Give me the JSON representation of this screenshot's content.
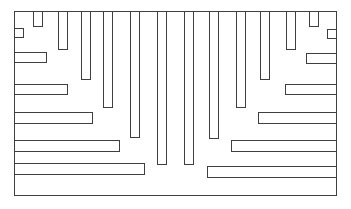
{
  "figure": {
    "type": "line-drawing",
    "canvas": {
      "width": 351,
      "height": 209,
      "background": "#ffffff"
    },
    "style": {
      "stroke": "#3f3f3f",
      "stroke_width_px": 1.5,
      "fill": "#ffffff"
    },
    "rects": [
      {
        "name": "outer-frame",
        "x": 14,
        "y": 11,
        "w": 323,
        "h": 185
      },
      {
        "name": "top-bar-1",
        "x": 33,
        "y": 11,
        "w": 10,
        "h": 16
      },
      {
        "name": "top-bar-2",
        "x": 58,
        "y": 11,
        "w": 10,
        "h": 39
      },
      {
        "name": "top-bar-3",
        "x": 81,
        "y": 11,
        "w": 10,
        "h": 69
      },
      {
        "name": "top-bar-4",
        "x": 103,
        "y": 11,
        "w": 10,
        "h": 97
      },
      {
        "name": "top-bar-5",
        "x": 130,
        "y": 11,
        "w": 10,
        "h": 127
      },
      {
        "name": "top-bar-6",
        "x": 157,
        "y": 11,
        "w": 10,
        "h": 154
      },
      {
        "name": "top-bar-7",
        "x": 184,
        "y": 11,
        "w": 10,
        "h": 154
      },
      {
        "name": "top-bar-8",
        "x": 209,
        "y": 11,
        "w": 10,
        "h": 128
      },
      {
        "name": "top-bar-9",
        "x": 236,
        "y": 11,
        "w": 10,
        "h": 97
      },
      {
        "name": "top-bar-10",
        "x": 260,
        "y": 11,
        "w": 10,
        "h": 69
      },
      {
        "name": "top-bar-11",
        "x": 286,
        "y": 11,
        "w": 10,
        "h": 39
      },
      {
        "name": "top-bar-12",
        "x": 309,
        "y": 11,
        "w": 10,
        "h": 16
      },
      {
        "name": "left-bar-1",
        "x": 14,
        "y": 28,
        "w": 10,
        "h": 10
      },
      {
        "name": "left-bar-2",
        "x": 14,
        "y": 52,
        "w": 33,
        "h": 11
      },
      {
        "name": "left-bar-3",
        "x": 14,
        "y": 84,
        "w": 54,
        "h": 11
      },
      {
        "name": "left-bar-4",
        "x": 14,
        "y": 112,
        "w": 79,
        "h": 12
      },
      {
        "name": "left-bar-5",
        "x": 14,
        "y": 140,
        "w": 106,
        "h": 12
      },
      {
        "name": "left-bar-6",
        "x": 14,
        "y": 163,
        "w": 131,
        "h": 12
      },
      {
        "name": "right-bar-1",
        "x": 327,
        "y": 29,
        "w": 10,
        "h": 10
      },
      {
        "name": "right-bar-2",
        "x": 306,
        "y": 53,
        "w": 31,
        "h": 11
      },
      {
        "name": "right-bar-3",
        "x": 285,
        "y": 84,
        "w": 52,
        "h": 11
      },
      {
        "name": "right-bar-4",
        "x": 258,
        "y": 112,
        "w": 79,
        "h": 12
      },
      {
        "name": "right-bar-5",
        "x": 231,
        "y": 140,
        "w": 106,
        "h": 12
      },
      {
        "name": "right-bar-6",
        "x": 207,
        "y": 166,
        "w": 130,
        "h": 12
      }
    ]
  }
}
